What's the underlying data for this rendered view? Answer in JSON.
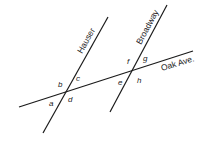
{
  "diagram": {
    "streets": {
      "hauser": "Hauser",
      "broadway": "Broadway",
      "oak": "Oak Ave."
    },
    "angles": {
      "a": "a",
      "b": "b",
      "c": "c",
      "d": "d",
      "e": "e",
      "f": "f",
      "g": "g",
      "h": "h"
    }
  }
}
